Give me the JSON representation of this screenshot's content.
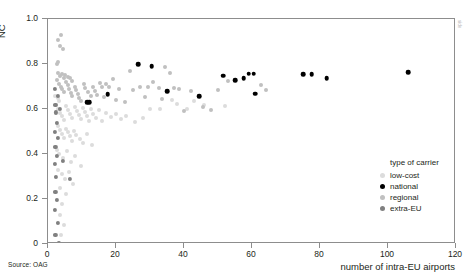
{
  "axes": {
    "y_label": "NC",
    "x_label": "number of intra-EU airports",
    "y_ticks": [
      "0",
      "0.2",
      "0.4",
      "0.6",
      "0.8",
      "1.0"
    ],
    "x_ticks": [
      "0",
      "20",
      "40",
      "60",
      "80",
      "100",
      "120"
    ]
  },
  "notes": {
    "source": "Source: OAG",
    "side": "side"
  },
  "legend": {
    "title": "type of carrier",
    "items": [
      {
        "label": "low-cost",
        "color": "#dcdcdc"
      },
      {
        "label": "national",
        "color": "#000000"
      },
      {
        "label": "regional",
        "color": "#c0c0c0"
      },
      {
        "label": "extra-EU",
        "color": "#808080"
      }
    ]
  },
  "chart_data": {
    "type": "scatter",
    "title": "",
    "xlabel": "number of intra-EU airports",
    "ylabel": "NC",
    "xlim": [
      0,
      120
    ],
    "ylim": [
      0,
      1.0
    ],
    "xticks": [
      0,
      20,
      40,
      60,
      80,
      100,
      120
    ],
    "yticks": [
      0,
      0.2,
      0.4,
      0.6,
      0.8,
      1.0
    ],
    "grid": false,
    "legend_position": "bottom-right",
    "series": [
      {
        "name": "national",
        "color": "#000000",
        "size": 4.6,
        "points": [
          [
            11.5,
            0.63
          ],
          [
            12.2,
            0.629
          ],
          [
            17.5,
            0.666
          ],
          [
            26.5,
            0.8
          ],
          [
            30.5,
            0.791
          ],
          [
            35.0,
            0.679
          ],
          [
            44.5,
            0.658
          ],
          [
            51.5,
            0.748
          ],
          [
            55.0,
            0.729
          ],
          [
            57.5,
            0.736
          ],
          [
            59.0,
            0.757
          ],
          [
            60.5,
            0.757
          ],
          [
            61.0,
            0.668
          ],
          [
            75.0,
            0.755
          ],
          [
            77.5,
            0.755
          ],
          [
            82.0,
            0.737
          ],
          [
            106.0,
            0.764
          ]
        ]
      },
      {
        "name": "extra-EU",
        "color": "#808080",
        "size": 4.2,
        "points": [
          [
            2.0,
            0.69
          ],
          [
            2.2,
            0.62
          ],
          [
            2.4,
            0.585
          ],
          [
            2.6,
            0.54
          ],
          [
            2.0,
            0.5
          ],
          [
            2.8,
            0.47
          ],
          [
            2.2,
            0.43
          ],
          [
            2.6,
            0.39
          ],
          [
            2.0,
            0.355
          ],
          [
            2.4,
            0.3
          ],
          [
            2.2,
            0.23
          ],
          [
            2.6,
            0.195
          ],
          [
            2.0,
            0.15
          ],
          [
            2.8,
            0.095
          ],
          [
            2.2,
            0.04
          ],
          [
            3.2,
            0.006
          ],
          [
            6.5,
            0.29
          ],
          [
            4.5,
            0.37
          ],
          [
            3.0,
            0.66
          ],
          [
            3.4,
            0.6
          ]
        ]
      },
      {
        "name": "regional",
        "color": "#c0c0c0",
        "size": 4.0,
        "points": [
          [
            2.5,
            0.73
          ],
          [
            3.2,
            0.712
          ],
          [
            3.8,
            0.7
          ],
          [
            4.2,
            0.688
          ],
          [
            4.8,
            0.676
          ],
          [
            5.3,
            0.722
          ],
          [
            5.8,
            0.706
          ],
          [
            6.2,
            0.69
          ],
          [
            6.8,
            0.672
          ],
          [
            7.2,
            0.656
          ],
          [
            7.8,
            0.7
          ],
          [
            8.2,
            0.684
          ],
          [
            8.8,
            0.668
          ],
          [
            9.2,
            0.65
          ],
          [
            9.8,
            0.634
          ],
          [
            10.5,
            0.712
          ],
          [
            11.0,
            0.694
          ],
          [
            11.8,
            0.676
          ],
          [
            12.5,
            0.66
          ],
          [
            13.2,
            0.7
          ],
          [
            13.8,
            0.682
          ],
          [
            14.5,
            0.663
          ],
          [
            15.2,
            0.716
          ],
          [
            15.8,
            0.697
          ],
          [
            16.5,
            0.652
          ],
          [
            17.2,
            0.713
          ],
          [
            18.0,
            0.696
          ],
          [
            19.0,
            0.733
          ],
          [
            20.0,
            0.64
          ],
          [
            21.0,
            0.69
          ],
          [
            22.5,
            0.632
          ],
          [
            24.0,
            0.77
          ],
          [
            25.0,
            0.686
          ],
          [
            27.0,
            0.7
          ],
          [
            28.5,
            0.654
          ],
          [
            29.5,
            0.698
          ],
          [
            31.0,
            0.722
          ],
          [
            32.5,
            0.692
          ],
          [
            33.5,
            0.646
          ],
          [
            34.5,
            0.786
          ],
          [
            36.0,
            0.758
          ],
          [
            37.0,
            0.694
          ],
          [
            38.5,
            0.689
          ],
          [
            40.0,
            0.592
          ],
          [
            42.0,
            0.679
          ],
          [
            45.5,
            0.608
          ],
          [
            48.0,
            0.595
          ],
          [
            50.0,
            0.684
          ],
          [
            53.0,
            0.724
          ],
          [
            62.5,
            0.708
          ],
          [
            64.0,
            0.686
          ],
          [
            3.0,
            0.76
          ],
          [
            3.6,
            0.745
          ],
          [
            4.0,
            0.755
          ],
          [
            4.6,
            0.74
          ],
          [
            5.0,
            0.75
          ],
          [
            6.0,
            0.742
          ],
          [
            6.6,
            0.736
          ],
          [
            7.0,
            0.726
          ],
          [
            2.8,
            0.81
          ],
          [
            3.4,
            0.878
          ],
          [
            3.0,
            0.905
          ],
          [
            3.8,
            0.928
          ],
          [
            4.4,
            0.866
          ],
          [
            2.6,
            0.8
          ]
        ]
      },
      {
        "name": "low-cost",
        "color": "#dcdcdc",
        "size": 4.0,
        "points": [
          [
            2.4,
            0.616
          ],
          [
            3.0,
            0.6
          ],
          [
            3.6,
            0.584
          ],
          [
            4.2,
            0.568
          ],
          [
            4.8,
            0.552
          ],
          [
            5.4,
            0.612
          ],
          [
            6.0,
            0.596
          ],
          [
            6.6,
            0.578
          ],
          [
            7.2,
            0.562
          ],
          [
            7.8,
            0.608
          ],
          [
            8.4,
            0.59
          ],
          [
            9.0,
            0.574
          ],
          [
            9.6,
            0.556
          ],
          [
            10.2,
            0.604
          ],
          [
            10.8,
            0.588
          ],
          [
            11.4,
            0.57
          ],
          [
            12.0,
            0.548
          ],
          [
            12.6,
            0.598
          ],
          [
            13.2,
            0.58
          ],
          [
            14.0,
            0.562
          ],
          [
            15.0,
            0.596
          ],
          [
            16.0,
            0.546
          ],
          [
            17.0,
            0.582
          ],
          [
            18.5,
            0.566
          ],
          [
            20.0,
            0.578
          ],
          [
            21.5,
            0.556
          ],
          [
            23.0,
            0.57
          ],
          [
            25.5,
            0.542
          ],
          [
            2.8,
            0.524
          ],
          [
            3.4,
            0.505
          ],
          [
            4.0,
            0.49
          ],
          [
            4.6,
            0.47
          ],
          [
            5.2,
            0.512
          ],
          [
            5.8,
            0.496
          ],
          [
            6.4,
            0.478
          ],
          [
            7.0,
            0.46
          ],
          [
            7.6,
            0.502
          ],
          [
            8.2,
            0.484
          ],
          [
            9.4,
            0.466
          ],
          [
            10.4,
            0.448
          ],
          [
            11.6,
            0.49
          ],
          [
            13.0,
            0.44
          ],
          [
            2.6,
            0.42
          ],
          [
            3.2,
            0.4
          ],
          [
            4.4,
            0.382
          ],
          [
            5.6,
            0.412
          ],
          [
            6.8,
            0.364
          ],
          [
            8.0,
            0.392
          ],
          [
            9.8,
            0.345
          ],
          [
            3.0,
            0.33
          ],
          [
            4.0,
            0.31
          ],
          [
            5.0,
            0.288
          ],
          [
            6.2,
            0.318
          ],
          [
            7.4,
            0.268
          ],
          [
            3.6,
            0.248
          ],
          [
            5.2,
            0.222
          ],
          [
            4.2,
            0.176
          ],
          [
            3.4,
            0.13
          ],
          [
            4.8,
            0.086
          ],
          [
            3.8,
            0.042
          ],
          [
            2.2,
            0.66
          ],
          [
            2.8,
            0.648
          ],
          [
            3.2,
            0.636
          ],
          [
            28.0,
            0.56
          ],
          [
            30.0,
            0.6
          ],
          [
            33.0,
            0.598
          ],
          [
            38.0,
            0.624
          ],
          [
            41.0,
            0.598
          ],
          [
            46.0,
            0.618
          ],
          [
            52.0,
            0.612
          ],
          [
            36.5,
            0.64
          ],
          [
            43.0,
            0.636
          ]
        ]
      }
    ]
  }
}
